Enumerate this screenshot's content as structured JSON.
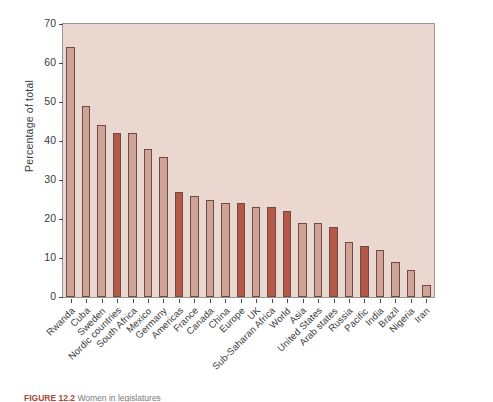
{
  "figure": {
    "caption_label": "FIGURE 12.2",
    "caption_text": "Women in legislatures"
  },
  "axes": {
    "ylabel": "Percentage of total",
    "yticks": [
      0,
      10,
      20,
      30,
      40,
      50,
      60,
      70
    ],
    "ymin": 0,
    "ymax": 70,
    "plot_background": "#e9d7d0",
    "bar_light_color": "#cfa398",
    "bar_dark_color": "#b4594a",
    "bar_edge_color": "#6e4a41"
  },
  "chart_data": {
    "type": "bar",
    "title": "Women in legislatures",
    "xlabel": "",
    "ylabel": "Percentage of total",
    "ylim": [
      0,
      70
    ],
    "grid": false,
    "legend": "none",
    "categories": [
      "Rwanda",
      "Cuba",
      "Sweden",
      "Nordic countries",
      "South Africa",
      "Mexico",
      "Germany",
      "Americas",
      "France",
      "Canada",
      "China",
      "Europe",
      "UK",
      "Sub-Saharan Africa",
      "World",
      "Asia",
      "United States",
      "Arab states",
      "Russia",
      "Pacific",
      "India",
      "Brazil",
      "Nigeria",
      "Iran"
    ],
    "values": [
      64,
      49,
      44,
      42,
      42,
      38,
      36,
      27,
      26,
      25,
      24,
      24,
      23,
      23,
      22,
      19,
      19,
      18,
      14,
      13,
      12,
      9,
      7,
      3
    ],
    "shades": [
      "light",
      "light",
      "light",
      "dark",
      "light",
      "light",
      "light",
      "dark",
      "light",
      "light",
      "light",
      "dark",
      "light",
      "dark",
      "dark",
      "light",
      "light",
      "dark",
      "light",
      "dark",
      "light",
      "light",
      "light",
      "light"
    ]
  }
}
